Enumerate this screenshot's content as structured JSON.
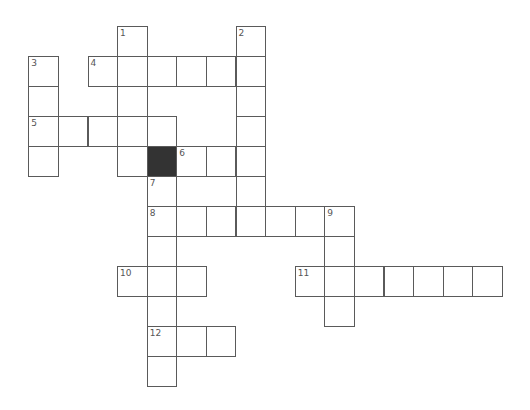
{
  "puzzle": {
    "cell_size_x": 29.6,
    "cell_size_y": 30,
    "origin_x": 28.3,
    "origin_y": 26,
    "colors": {
      "grid_line": "#5a5a5a",
      "block": "#333333",
      "number": "#555555",
      "background": "#ffffff"
    },
    "blocks": [
      {
        "col": 4,
        "row": 4
      }
    ],
    "entries": [
      {
        "number": "1",
        "direction": "down",
        "col": 3,
        "row": 0,
        "length": 5
      },
      {
        "number": "2",
        "direction": "down",
        "col": 7,
        "row": 0,
        "length": 7
      },
      {
        "number": "3",
        "direction": "down",
        "col": 0,
        "row": 1,
        "length": 4
      },
      {
        "number": "4",
        "direction": "across",
        "col": 2,
        "row": 1,
        "length": 6
      },
      {
        "number": "5",
        "direction": "across",
        "col": 0,
        "row": 3,
        "length": 5
      },
      {
        "number": "6",
        "direction": "across",
        "col": 5,
        "row": 4,
        "length": 3
      },
      {
        "number": "7",
        "direction": "down",
        "col": 4,
        "row": 5,
        "length": 7
      },
      {
        "number": "8",
        "direction": "across",
        "col": 4,
        "row": 6,
        "length": 7
      },
      {
        "number": "9",
        "direction": "down",
        "col": 10,
        "row": 6,
        "length": 4
      },
      {
        "number": "10",
        "direction": "across",
        "col": 3,
        "row": 8,
        "length": 3
      },
      {
        "number": "11",
        "direction": "across",
        "col": 9,
        "row": 8,
        "length": 7
      },
      {
        "number": "12",
        "direction": "across",
        "col": 4,
        "row": 10,
        "length": 3
      }
    ]
  }
}
